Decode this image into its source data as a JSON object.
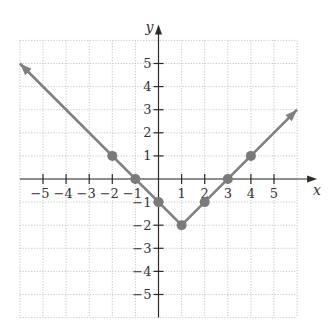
{
  "chart_data": {
    "type": "line",
    "title": "",
    "function": "y = |x - 1| - 2",
    "xlabel": "x",
    "ylabel": "y",
    "xlim": [
      -6,
      6
    ],
    "ylim": [
      -6,
      6
    ],
    "grid": true,
    "grid_style": "dotted",
    "x_ticks": [
      -5,
      -4,
      -3,
      -2,
      -1,
      1,
      2,
      3,
      4,
      5
    ],
    "y_ticks": [
      5,
      4,
      3,
      2,
      1,
      -1,
      -2,
      -3,
      -4,
      -5
    ],
    "x_tick_labels": [
      "−5",
      "−4",
      "−3",
      "−2",
      "−1",
      "1",
      "2",
      "3",
      "4",
      "5"
    ],
    "y_tick_labels": [
      "5",
      "4",
      "3",
      "2",
      "1",
      "−1",
      "−2",
      "−3",
      "−4",
      "−5"
    ],
    "series": [
      {
        "name": "y = |x - 1| - 2",
        "line_points": [
          [
            -6,
            5
          ],
          [
            1,
            -2
          ],
          [
            6,
            3
          ]
        ],
        "arrows": [
          "start",
          "end"
        ],
        "marked_points": [
          [
            -2,
            1
          ],
          [
            -1,
            0
          ],
          [
            0,
            -1
          ],
          [
            1,
            -2
          ],
          [
            2,
            -1
          ],
          [
            3,
            0
          ],
          [
            4,
            1
          ]
        ],
        "color": "#808080"
      }
    ]
  },
  "layout": {
    "origin_px": [
      158.5,
      179
    ],
    "unit_px": 23.1
  }
}
